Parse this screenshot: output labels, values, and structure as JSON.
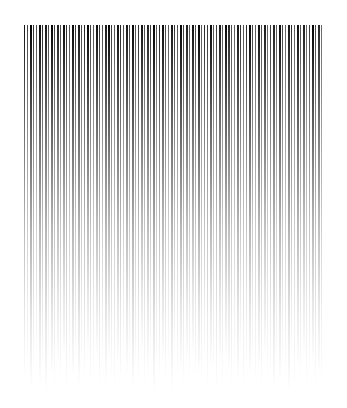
{
  "artwork": {
    "title": "Vertical Line Gradient",
    "kind": "abstract-line-pattern",
    "background_color": "#ffffff",
    "stroke_color": "#000000",
    "canvas": {
      "width": 347,
      "height": 408
    },
    "field": {
      "x_start": 24,
      "x_end": 322,
      "y_start": 25,
      "y_min_end": 352,
      "y_max_end": 392,
      "pitch": 3.0,
      "line_count": 100,
      "fade_description": "each stripe is a vertical linear gradient running from opaque dark at the top to fully transparent at its own lower terminus"
    }
  },
  "chart_data": {
    "type": "bar",
    "subtitle": "",
    "xlabel": "",
    "ylabel": "",
    "grid": false,
    "legend": null,
    "orientation": "vertical",
    "baseline": "top",
    "xlim": [
      24,
      322
    ],
    "ylim": [
      25,
      392
    ],
    "categories": [
      "L1",
      "L2",
      "L3",
      "L4",
      "L5",
      "L6",
      "L7",
      "L8",
      "L9",
      "L10",
      "L11",
      "L12",
      "L13",
      "L14",
      "L15",
      "L16",
      "L17",
      "L18",
      "L19",
      "L20",
      "L21",
      "L22",
      "L23",
      "L24",
      "L25",
      "L26",
      "L27",
      "L28",
      "L29",
      "L30",
      "L31",
      "L32",
      "L33",
      "L34",
      "L35",
      "L36",
      "L37",
      "L38",
      "L39",
      "L40",
      "L41",
      "L42",
      "L43",
      "L44",
      "L45",
      "L46",
      "L47",
      "L48",
      "L49",
      "L50",
      "L51",
      "L52",
      "L53",
      "L54",
      "L55",
      "L56",
      "L57",
      "L58",
      "L59",
      "L60",
      "L61",
      "L62",
      "L63",
      "L64",
      "L65",
      "L66",
      "L67",
      "L68",
      "L69",
      "L70",
      "L71",
      "L72",
      "L73",
      "L74",
      "L75",
      "L76",
      "L77",
      "L78",
      "L79",
      "L80",
      "L81",
      "L82",
      "L83",
      "L84",
      "L85",
      "L86",
      "L87",
      "L88",
      "L89",
      "L90",
      "L91",
      "L92",
      "L93",
      "L94",
      "L95",
      "L96",
      "L97",
      "L98",
      "L99",
      "L100"
    ],
    "x": [
      24.0,
      27.0,
      30.0,
      33.0,
      36.0,
      39.0,
      42.0,
      45.0,
      48.0,
      51.0,
      54.0,
      57.0,
      60.0,
      63.0,
      66.0,
      69.0,
      72.0,
      75.0,
      78.0,
      81.0,
      84.0,
      87.0,
      90.0,
      93.0,
      96.0,
      99.0,
      102.0,
      105.0,
      108.0,
      111.0,
      114.0,
      117.0,
      120.0,
      123.0,
      126.0,
      129.0,
      132.0,
      135.0,
      138.0,
      141.0,
      144.0,
      147.0,
      150.0,
      153.0,
      156.0,
      159.0,
      162.0,
      165.0,
      168.0,
      171.0,
      174.0,
      177.0,
      180.0,
      183.0,
      186.0,
      189.0,
      192.0,
      195.0,
      198.0,
      201.0,
      204.0,
      207.0,
      210.0,
      213.0,
      216.0,
      219.0,
      222.0,
      225.0,
      228.0,
      231.0,
      234.0,
      237.0,
      240.0,
      243.0,
      246.0,
      249.0,
      252.0,
      255.0,
      258.0,
      261.0,
      264.0,
      267.0,
      270.0,
      273.0,
      276.0,
      279.0,
      282.0,
      285.0,
      288.0,
      291.0,
      294.0,
      297.0,
      300.0,
      303.0,
      306.0,
      309.0,
      312.0,
      315.0,
      318.0,
      321.0
    ],
    "series": [
      {
        "name": "stripe_bottom_y",
        "values": [
          378,
          362,
          389,
          371,
          355,
          384,
          368,
          392,
          359,
          375,
          386,
          364,
          381,
          357,
          390,
          369,
          376,
          361,
          387,
          366,
          379,
          353,
          385,
          372,
          358,
          391,
          367,
          383,
          360,
          377,
          388,
          363,
          380,
          356,
          374,
          365,
          389,
          370,
          382,
          354,
          386,
          373,
          359,
          392,
          368,
          378,
          361,
          384,
          366,
          390,
          357,
          376,
          371,
          387,
          363,
          381,
          355,
          379,
          374,
          385,
          360,
          388,
          367,
          377,
          391,
          364,
          383,
          358,
          372,
          386,
          369,
          380,
          353,
          389,
          365,
          375,
          362,
          384,
          370,
          387,
          356,
          378,
          373,
          390,
          361,
          382,
          366,
          376,
          392,
          359,
          385,
          368,
          379,
          357,
          388,
          371,
          363,
          386,
          374,
          381
        ]
      },
      {
        "name": "stripe_width_px",
        "values": [
          1.4,
          1.0,
          1.8,
          1.2,
          1.0,
          2.0,
          1.3,
          1.6,
          1.0,
          1.9,
          1.1,
          1.5,
          1.0,
          1.8,
          1.3,
          1.0,
          2.0,
          1.2,
          1.6,
          1.0,
          1.4,
          1.9,
          1.1,
          1.0,
          1.7,
          1.3,
          1.0,
          1.5,
          2.0,
          1.2,
          1.0,
          1.8,
          1.4,
          1.0,
          1.6,
          1.1,
          1.9,
          1.0,
          1.3,
          1.7,
          1.0,
          1.5,
          1.2,
          2.0,
          1.0,
          1.4,
          1.8,
          1.1,
          1.0,
          1.6,
          1.3,
          1.0,
          1.9,
          1.2,
          1.5,
          1.0,
          1.7,
          1.1,
          2.0,
          1.0,
          1.4,
          1.3,
          1.8,
          1.0,
          1.2,
          1.6,
          1.0,
          1.9,
          1.5,
          1.1,
          1.0,
          1.7,
          1.3,
          1.0,
          1.4,
          2.0,
          1.2,
          1.0,
          1.8,
          1.1,
          1.6,
          1.0,
          1.3,
          1.5,
          1.0,
          1.9,
          1.2,
          1.0,
          1.7,
          1.4,
          1.0,
          1.8,
          1.1,
          1.6,
          1.0,
          1.3,
          2.0,
          1.2,
          1.5,
          1.0
        ]
      },
      {
        "name": "stripe_top_darkness",
        "values": [
          0.92,
          0.74,
          0.99,
          0.81,
          0.7,
          0.96,
          0.84,
          0.9,
          0.72,
          0.98,
          0.76,
          0.88,
          0.71,
          0.95,
          0.83,
          0.69,
          0.97,
          0.79,
          0.91,
          0.73,
          0.86,
          0.99,
          0.75,
          0.68,
          0.93,
          0.8,
          0.7,
          0.89,
          0.98,
          0.77,
          0.67,
          0.94,
          0.85,
          0.71,
          0.9,
          0.74,
          0.97,
          0.69,
          0.82,
          0.92,
          0.7,
          0.87,
          0.78,
          0.99,
          0.68,
          0.85,
          0.95,
          0.73,
          0.66,
          0.91,
          0.8,
          0.69,
          0.98,
          0.76,
          0.88,
          0.67,
          0.93,
          0.72,
          0.99,
          0.65,
          0.84,
          0.79,
          0.96,
          0.68,
          0.77,
          0.9,
          0.66,
          0.97,
          0.86,
          0.71,
          0.64,
          0.92,
          0.81,
          0.67,
          0.83,
          0.98,
          0.75,
          0.65,
          0.94,
          0.7,
          0.89,
          0.63,
          0.78,
          0.87,
          0.66,
          0.96,
          0.74,
          0.62,
          0.91,
          0.82,
          0.64,
          0.95,
          0.69,
          0.88,
          0.61,
          0.77,
          0.99,
          0.73,
          0.85,
          0.6
        ]
      }
    ]
  }
}
